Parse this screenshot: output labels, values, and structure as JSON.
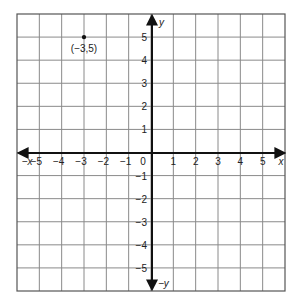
{
  "diagram": {
    "type": "coordinate-plane",
    "grid": {
      "x_min": -6,
      "x_max": 6,
      "y_min": -6,
      "y_max": 6,
      "step": 1
    },
    "axes": {
      "x_label": "x",
      "neg_x_label": "−x",
      "y_label": "y",
      "neg_y_label": "−y",
      "origin_label": "0"
    },
    "x_ticks": [
      {
        "value": -5,
        "label": "−5"
      },
      {
        "value": -4,
        "label": "−4"
      },
      {
        "value": -3,
        "label": "−3"
      },
      {
        "value": -2,
        "label": "−2"
      },
      {
        "value": -1,
        "label": "−1"
      },
      {
        "value": 1,
        "label": "1"
      },
      {
        "value": 2,
        "label": "2"
      },
      {
        "value": 3,
        "label": "3"
      },
      {
        "value": 4,
        "label": "4"
      },
      {
        "value": 5,
        "label": "5"
      }
    ],
    "y_ticks": [
      {
        "value": 5,
        "label": "5"
      },
      {
        "value": 4,
        "label": "4"
      },
      {
        "value": 3,
        "label": "3"
      },
      {
        "value": 2,
        "label": "2"
      },
      {
        "value": 1,
        "label": "1"
      },
      {
        "value": -1,
        "label": "−1"
      },
      {
        "value": -2,
        "label": "−2"
      },
      {
        "value": -3,
        "label": "−3"
      },
      {
        "value": -4,
        "label": "−4"
      },
      {
        "value": -5,
        "label": "−5"
      }
    ],
    "points": [
      {
        "x": -3,
        "y": 5,
        "label": "(−3,5)"
      }
    ],
    "colors": {
      "grid": "#8a8a8a",
      "axis": "#111111",
      "point": "#111111",
      "border": "#555555"
    }
  }
}
